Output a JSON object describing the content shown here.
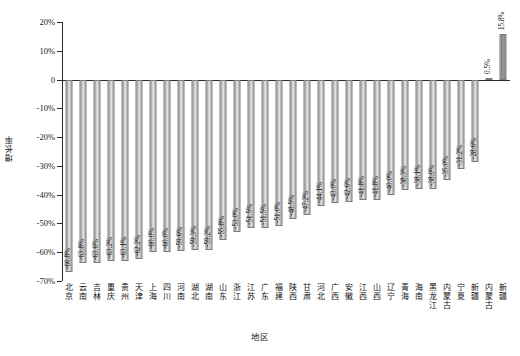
{
  "chart_data": {
    "type": "bar",
    "title": "",
    "xlabel": "地区",
    "ylabel": "增长率",
    "ylim": [
      -70,
      20
    ],
    "ytick_labels": [
      "20%",
      "10%",
      "0",
      "-10%",
      "-20%",
      "-30%",
      "-40%",
      "-50%",
      "-60%",
      "-70%"
    ],
    "ytick_values": [
      20,
      10,
      0,
      -10,
      -20,
      -30,
      -40,
      -50,
      -60,
      -70
    ],
    "grid": false,
    "legend": "none",
    "categories": [
      "北京",
      "云南",
      "吉林",
      "重庆",
      "贵州",
      "天津",
      "上海",
      "四川",
      "河南",
      "湖北",
      "湖南",
      "山东",
      "浙江",
      "江苏",
      "广东",
      "福建",
      "陕西",
      "甘肃",
      "河北",
      "广西",
      "安徽",
      "江西",
      "山西",
      "辽宁",
      "青海",
      "海南",
      "黑龙江",
      "内蒙古",
      "宁夏",
      "新疆"
    ],
    "values": [
      -66.8,
      -63.8,
      -63.6,
      -63.2,
      -63.1,
      -62.2,
      -60.0,
      -60.0,
      -59.6,
      -59.3,
      -59.2,
      -55.8,
      -53.0,
      -51.5,
      -51.5,
      -51.0,
      -48.5,
      -47.2,
      -44.1,
      -43.0,
      -42.6,
      -41.8,
      -41.8,
      -40.0,
      -38.3,
      -38.1,
      -38.0,
      -35.0,
      -31.2,
      -28.6
    ],
    "value_labels": [
      "-66.8%",
      "-63.8%",
      "-63.6%",
      "-63.2%",
      "-63.1%",
      "-62.2%",
      "-60.0%",
      "-60.0%",
      "-59.6%",
      "-59.3%",
      "-59.2%",
      "-55.8%",
      "-53.0%",
      "-51.5%",
      "-51.5%",
      "-51.0%",
      "-48.5%",
      "-47.2%",
      "-44.1%",
      "-43.0%",
      "-42.6%",
      "-41.8%",
      "-41.8%",
      "-40.0%",
      "-38.3%",
      "-38.1%",
      "-38.0%",
      "-35.0%",
      "-31.2%",
      "-28.6%"
    ],
    "extra_categories": [
      "内蒙古",
      "新疆"
    ],
    "extra_values": [
      0.5,
      15.8
    ],
    "extra_value_labels": [
      "0.5%",
      "15.8%"
    ],
    "bar_color": "#b5b5b5",
    "bar_edge_color": "#7a7a7a"
  },
  "figure": {
    "caption": ""
  }
}
